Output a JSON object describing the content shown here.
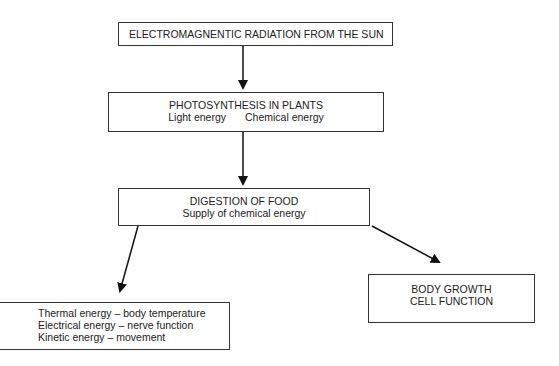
{
  "diagram": {
    "nodes": {
      "sun": {
        "label": "ELECTROMAGNENTIC RADIATION FROM THE SUN"
      },
      "photosynthesis": {
        "title": "PHOTOSYNTHESIS IN PLANTS",
        "items": [
          "Light energy",
          "Chemical energy"
        ]
      },
      "digestion": {
        "title": "DIGESTION OF FOOD",
        "subtitle": "Supply of chemical energy"
      },
      "energy_uses": {
        "lines": [
          "Thermal energy – body temperature",
          "Electrical energy – nerve function",
          "Kinetic energy – movement"
        ]
      },
      "growth": {
        "lines": [
          "BODY GROWTH",
          "CELL FUNCTION"
        ]
      }
    },
    "edges": [
      {
        "from": "sun",
        "to": "photosynthesis"
      },
      {
        "from": "photosynthesis",
        "to": "digestion"
      },
      {
        "from": "digestion",
        "to": "energy_uses"
      },
      {
        "from": "digestion",
        "to": "growth"
      }
    ],
    "colors": {
      "stroke": "#222222",
      "background": "#ffffff",
      "text": "#222222"
    }
  }
}
